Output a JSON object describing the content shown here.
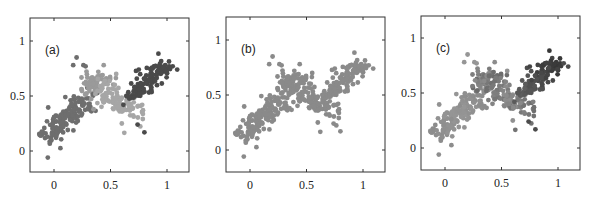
{
  "chart_data": [
    {
      "type": "scatter",
      "panel_label": "(a)",
      "coloring": "by_cluster",
      "xlim": [
        -0.2,
        1.15
      ],
      "ylim": [
        -0.2,
        1.2
      ],
      "xticks": [
        0,
        0.5,
        1
      ],
      "xtick_labels": [
        "0",
        "0.5",
        "1"
      ],
      "yticks": [
        0,
        0.5,
        1
      ],
      "ytick_labels": [
        "0",
        "0.5",
        "1"
      ],
      "grid": false,
      "legend": null,
      "description": "Noisy zig-zag point cloud segmented into 4 clusters shown with different gray shades"
    },
    {
      "type": "scatter",
      "panel_label": "(b)",
      "coloring": "uniform",
      "xlim": [
        -0.2,
        1.15
      ],
      "ylim": [
        -0.2,
        1.2
      ],
      "xticks": [
        0,
        0.5,
        1
      ],
      "xtick_labels": [
        "0",
        "0.5",
        "1"
      ],
      "yticks": [
        0,
        0.5,
        1
      ],
      "ytick_labels": [
        "0",
        "0.5",
        "1"
      ],
      "grid": false,
      "legend": null,
      "description": "Same point cloud, all points one gray"
    },
    {
      "type": "scatter",
      "panel_label": "(c)",
      "coloring": "gradient",
      "xlim": [
        -0.2,
        1.15
      ],
      "ylim": [
        -0.2,
        1.2
      ],
      "xticks": [
        0,
        0.5,
        1
      ],
      "xtick_labels": [
        "0",
        "0.5",
        "1"
      ],
      "yticks": [
        0,
        0.5,
        1
      ],
      "ytick_labels": [
        "0",
        "0.5",
        "1"
      ],
      "grid": false,
      "legend": null,
      "description": "Same point cloud with soft shading, darker near segment junctions"
    }
  ],
  "clusters": [
    {
      "name": "segment-1",
      "x0": -0.08,
      "y0": 0.12,
      "x1": 0.3,
      "y1": 0.48,
      "n": 150,
      "spread": 0.055,
      "color_a": "#6e6e6e"
    },
    {
      "name": "segment-2",
      "x0": 0.28,
      "y0": 0.58,
      "x1": 0.45,
      "y1": 0.62,
      "n": 60,
      "spread": 0.045,
      "color_a": "#9a9a9a"
    },
    {
      "name": "segment-3",
      "x0": 0.42,
      "y0": 0.55,
      "x1": 0.72,
      "y1": 0.35,
      "n": 110,
      "spread": 0.055,
      "color_a": "#a6a6a6"
    },
    {
      "name": "segment-4",
      "x0": 0.65,
      "y0": 0.48,
      "x1": 1.0,
      "y1": 0.78,
      "n": 110,
      "spread": 0.05,
      "color_a": "#4a4a4a"
    }
  ],
  "outliers": [
    [
      0.17,
      0.78
    ],
    [
      0.2,
      0.85
    ],
    [
      0.26,
      0.78
    ],
    [
      0.28,
      0.77
    ],
    [
      0.44,
      0.78
    ],
    [
      0.55,
      0.7
    ],
    [
      0.8,
      0.17
    ],
    [
      0.35,
      0.38
    ],
    [
      0.6,
      0.25
    ],
    [
      0.1,
      0.49
    ],
    [
      0.92,
      0.73
    ],
    [
      1.05,
      0.77
    ],
    [
      1.09,
      0.74
    ],
    [
      0.74,
      0.24
    ]
  ],
  "colors": {
    "uniform": "#8a8a8a",
    "axis": "#333333",
    "background": "#ffffff"
  }
}
